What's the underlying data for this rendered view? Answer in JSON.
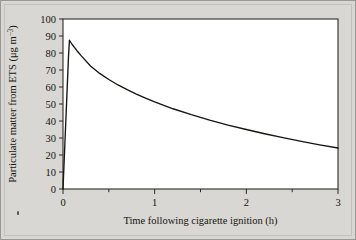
{
  "figure": {
    "background_color": "#d9d7d3",
    "plot_background_color": "#ffffff",
    "frame_color": "#2a2a26",
    "curve_color": "#16150f",
    "corner_mark": "·"
  },
  "axes": {
    "y": {
      "title_main": "Particulate matter from ETS (",
      "title_unit_mu": "μg m",
      "title_unit_exp": "−3",
      "title_close": ")",
      "title_full": "Particulate matter from ETS (μg m⁻³)",
      "ticks": [
        "0",
        "10",
        "20",
        "30",
        "40",
        "50",
        "60",
        "70",
        "80",
        "90",
        "100"
      ],
      "min": 0,
      "max": 100,
      "step": 10
    },
    "x": {
      "title": "Time following cigarette ignition (h)",
      "ticks": [
        "0",
        "1",
        "2",
        "3"
      ],
      "minor_ticks": [
        "0.5",
        "1.5",
        "2.5"
      ],
      "min": 0,
      "max": 3,
      "step": 1
    }
  },
  "chart_data": {
    "type": "line",
    "title": "",
    "xlabel": "Time following cigarette ignition (h)",
    "ylabel": "Particulate matter from ETS (μg m⁻³)",
    "xlim": [
      0,
      3
    ],
    "ylim": [
      0,
      100
    ],
    "xticks": [
      0,
      1,
      2,
      3
    ],
    "yticks": [
      0,
      10,
      20,
      30,
      40,
      50,
      60,
      70,
      80,
      90,
      100
    ],
    "grid": false,
    "legend": false,
    "series": [
      {
        "name": "Particulate matter from ETS",
        "x": [
          0.0,
          0.01,
          0.02,
          0.03,
          0.04,
          0.05,
          0.06,
          0.07,
          0.1,
          0.15,
          0.2,
          0.3,
          0.4,
          0.5,
          0.6,
          0.7,
          0.8,
          0.9,
          1.0,
          1.2,
          1.4,
          1.6,
          1.8,
          2.0,
          2.2,
          2.4,
          2.6,
          2.8,
          3.0
        ],
        "y": [
          0.0,
          13.0,
          26.0,
          39.0,
          52.0,
          65.0,
          78.0,
          87.5,
          85.0,
          81.5,
          78.3,
          72.4,
          68.0,
          64.4,
          61.2,
          58.4,
          55.8,
          53.4,
          51.2,
          47.2,
          43.7,
          40.5,
          37.6,
          35.0,
          32.5,
          30.2,
          28.0,
          26.0,
          24.1
        ]
      }
    ]
  }
}
